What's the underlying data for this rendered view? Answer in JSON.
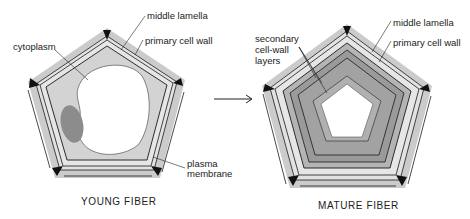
{
  "young": {
    "caption": "YOUNG FIBER",
    "labels": {
      "middle_lamella": "middle lamella",
      "primary_wall": "primary cell wall",
      "cytoplasm": "cytoplasm",
      "plasma_1": "plasma",
      "plasma_2": "membrane"
    }
  },
  "mature": {
    "caption": "MATURE FIBER",
    "labels": {
      "middle_lamella": "middle lamella",
      "primary_wall": "primary cell wall",
      "secondary_1": "secondary",
      "secondary_2": "cell-wall",
      "secondary_3": "layers"
    }
  },
  "arrow": "→",
  "colors": {
    "outer_gray": "#c8c8c8",
    "light_band": "#e4e4e4",
    "cytoplasm": "#cfcfcf",
    "nucleus": "#8a8a8a",
    "secondary_wall": "#9a9a9a",
    "secondary_inner": "#b0b0b0",
    "line": "#1a1a1a"
  }
}
